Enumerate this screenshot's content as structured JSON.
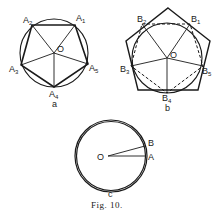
{
  "figure": {
    "caption": "Fig. 10.",
    "stroke_color": "#1a1a1a",
    "background": "#ffffff"
  },
  "diagram_a": {
    "sublabel": "a",
    "center_label": "O",
    "vertex_labels": [
      "A1",
      "A2",
      "A3",
      "A4",
      "A5"
    ],
    "description": "Regular pentagon A1A2A3A4A5 inscribed in circle with center O; radii from O to each vertex"
  },
  "diagram_b": {
    "sublabel": "b",
    "center_label": "O",
    "vertex_labels": [
      "B1",
      "B2",
      "B3",
      "B4",
      "B5"
    ],
    "description": "Circle inscribed in regular pentagon; tangent points B1..B5 joined by dashed inscribed pentagon; radii from O"
  },
  "diagram_c": {
    "sublabel": "c",
    "center_label": "O",
    "point_labels": [
      "A",
      "B"
    ],
    "description": "Circle approximated by many-sided inscribed and circumscribed polygons; radii OA and OB"
  }
}
